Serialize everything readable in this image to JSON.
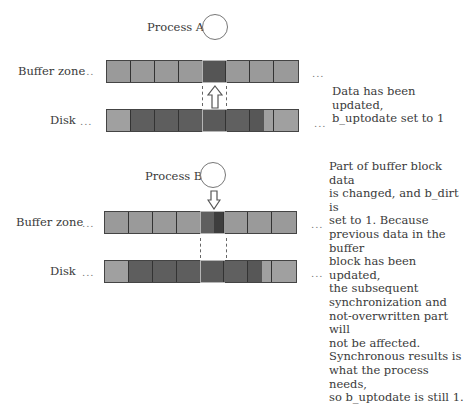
{
  "top": {
    "process_label": "Process A",
    "buffer_label": "Buffer zone",
    "disk_label": "Disk",
    "ellipsis": "...",
    "note_lines": [
      "Data has been updated,",
      "b_uptodate set to 1"
    ],
    "arrow": "up",
    "buffer_cells": [
      "#9a9a9a",
      "#9a9a9a",
      "#9a9a9a",
      "#9a9a9a",
      "#555555",
      "#9a9a9a",
      "#9a9a9a",
      "#9a9a9a"
    ],
    "disk_cells": [
      "#a0a0a0",
      "#5e5e5e",
      "#5e5e5e",
      "#5e5e5e",
      "#5a5a5a",
      "#606060",
      "#575757|#a0a0a0",
      "#a0a0a0"
    ]
  },
  "bottom": {
    "process_label": "Process B",
    "buffer_label": "Buffer zone",
    "disk_label": "Disk",
    "ellipsis": "...",
    "arrow": "down",
    "note_lines": [
      "Part of buffer block data",
      "is changed, and b_dirt is",
      "set to 1. Because",
      "previous data in the buffer",
      "block has been updated,",
      "the subsequent",
      "synchronization and",
      "not-overwritten part will",
      "not be affected.",
      "Synchronous results is",
      "what the process needs,",
      "so b_uptodate is still 1."
    ],
    "buffer_cells": [
      "#9a9a9a",
      "#9a9a9a",
      "#9a9a9a",
      "#9a9a9a",
      "#5f5f5f|#3e3e3e",
      "#9a9a9a",
      "#9a9a9a",
      "#9a9a9a"
    ],
    "disk_cells": [
      "#a0a0a0",
      "#5e5e5e",
      "#5e5e5e",
      "#5e5e5e",
      "#5a5a5a",
      "#606060",
      "#575757|#a0a0a0",
      "#a0a0a0"
    ]
  }
}
